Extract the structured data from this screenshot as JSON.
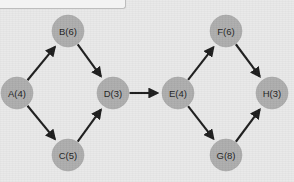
{
  "canvas": {
    "width": 294,
    "height": 182,
    "background_color": "#e9e9e9"
  },
  "top_bar": {
    "name": "partial-toolbar-strip",
    "fill_color": "#f3f3f3",
    "border_color": "#bdbdbd"
  },
  "diagram": {
    "type": "directed-acyclic-graph",
    "node_fill_color": "#adadad",
    "edge_color": "#1c1c1c",
    "node_radius": 16,
    "nodes": [
      {
        "id": "A",
        "label": "A(4)",
        "value": 4,
        "cx": 17,
        "cy": 93
      },
      {
        "id": "B",
        "label": "B(6)",
        "value": 6,
        "cx": 68,
        "cy": 31
      },
      {
        "id": "C",
        "label": "C(5)",
        "value": 5,
        "cx": 68,
        "cy": 155
      },
      {
        "id": "D",
        "label": "D(3)",
        "value": 3,
        "cx": 113,
        "cy": 93
      },
      {
        "id": "E",
        "label": "E(4)",
        "value": 4,
        "cx": 178,
        "cy": 93
      },
      {
        "id": "F",
        "label": "F(6)",
        "value": 6,
        "cx": 226,
        "cy": 31
      },
      {
        "id": "G",
        "label": "G(8)",
        "value": 8,
        "cx": 226,
        "cy": 155
      },
      {
        "id": "H",
        "label": "H(3)",
        "value": 3,
        "cx": 272,
        "cy": 93
      }
    ],
    "edges": [
      {
        "from": "A",
        "to": "B"
      },
      {
        "from": "A",
        "to": "C"
      },
      {
        "from": "B",
        "to": "D"
      },
      {
        "from": "C",
        "to": "D"
      },
      {
        "from": "D",
        "to": "E"
      },
      {
        "from": "E",
        "to": "F"
      },
      {
        "from": "E",
        "to": "G"
      },
      {
        "from": "F",
        "to": "H"
      },
      {
        "from": "G",
        "to": "H"
      }
    ]
  }
}
